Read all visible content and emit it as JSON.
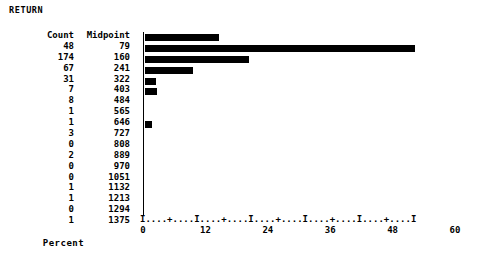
{
  "title": "RETURN",
  "table": {
    "headers": {
      "count": "Count",
      "midpoint": "Midpoint"
    },
    "rows": [
      {
        "count": "48",
        "midpoint": "79"
      },
      {
        "count": "174",
        "midpoint": "160"
      },
      {
        "count": "67",
        "midpoint": "241"
      },
      {
        "count": "31",
        "midpoint": "322"
      },
      {
        "count": "7",
        "midpoint": "403"
      },
      {
        "count": "8",
        "midpoint": "484"
      },
      {
        "count": "1",
        "midpoint": "565"
      },
      {
        "count": "1",
        "midpoint": "646"
      },
      {
        "count": "3",
        "midpoint": "727"
      },
      {
        "count": "0",
        "midpoint": "808"
      },
      {
        "count": "2",
        "midpoint": "889"
      },
      {
        "count": "0",
        "midpoint": "970"
      },
      {
        "count": "0",
        "midpoint": "1051"
      },
      {
        "count": "1",
        "midpoint": "1132"
      },
      {
        "count": "1",
        "midpoint": "1213"
      },
      {
        "count": "0",
        "midpoint": "1294"
      },
      {
        "count": "1",
        "midpoint": "1375"
      }
    ]
  },
  "axis": {
    "ruler": "I....+....I....+....I....+....I....+....I....+....I",
    "ticks": [
      "0",
      "12",
      "24",
      "36",
      "48",
      "60"
    ],
    "xlabel": "Percent"
  },
  "colors": {
    "bar": "#000000",
    "axis": "#000000",
    "text": "#000000",
    "background": "#ffffff"
  },
  "chart_data": {
    "type": "bar",
    "orientation": "horizontal",
    "title": "RETURN",
    "xlabel": "Percent",
    "ylabel": "Midpoint",
    "xlim": [
      0,
      60
    ],
    "xticks": [
      0,
      12,
      24,
      36,
      48,
      60
    ],
    "grid": false,
    "legend": null,
    "categories": [
      79,
      160,
      241,
      322,
      403,
      484,
      565,
      646,
      727,
      808,
      889,
      970,
      1051,
      1132,
      1213,
      1294,
      1375
    ],
    "counts": [
      48,
      174,
      67,
      31,
      7,
      8,
      1,
      1,
      3,
      0,
      2,
      0,
      0,
      1,
      1,
      0,
      1
    ],
    "values": [
      14.3,
      51.9,
      20.0,
      9.3,
      2.1,
      2.4,
      0.3,
      0.3,
      0.9,
      0.0,
      0.6,
      0.0,
      0.0,
      0.3,
      0.3,
      0.0,
      0.3
    ],
    "total_count": 335
  }
}
